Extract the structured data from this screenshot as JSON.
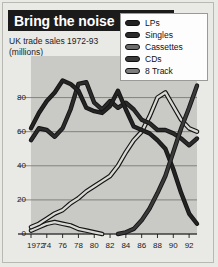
{
  "header": {
    "title": "Bring the noise",
    "subtitle_line1": "UK trade sales 1972-93",
    "subtitle_line2": "(millions)"
  },
  "source_note": "Source: BPI Surveys",
  "legend": {
    "items": [
      {
        "label": "LPs",
        "color": "#232323"
      },
      {
        "label": "Singles",
        "color": "#2b2b2b"
      },
      {
        "label": "Cassettes",
        "color": "#6b6b6b"
      },
      {
        "label": "CDs",
        "color": "#3a3a3a"
      },
      {
        "label": "8 Track",
        "color": "#7d7d7d"
      }
    ]
  },
  "chart_data": {
    "type": "line",
    "title": "Bring the noise",
    "subtitle": "UK trade sales 1972-93 (millions)",
    "xlabel": "",
    "ylabel": "millions",
    "xlim": [
      1972,
      1993
    ],
    "ylim": [
      0,
      95
    ],
    "yticks": [
      0,
      20,
      40,
      60,
      80
    ],
    "xticks": [
      1972,
      1974,
      1976,
      1978,
      1980,
      1982,
      1984,
      1986,
      1988,
      1990,
      1992
    ],
    "xtick_labels": [
      "1972",
      "74",
      "76",
      "78",
      "80",
      "82",
      "84",
      "86",
      "88",
      "90",
      "92"
    ],
    "grid": true,
    "legend_position": "top-right",
    "x": [
      1972,
      1973,
      1974,
      1975,
      1976,
      1977,
      1978,
      1979,
      1980,
      1981,
      1982,
      1983,
      1984,
      1985,
      1986,
      1987,
      1988,
      1989,
      1990,
      1991,
      1992,
      1993
    ],
    "series": [
      {
        "name": "LPs",
        "color": "#232323",
        "values": [
          62,
          71,
          78,
          83,
          90,
          88,
          84,
          74,
          72,
          71,
          75,
          84,
          73,
          63,
          61,
          59,
          55,
          50,
          38,
          24,
          12,
          6
        ]
      },
      {
        "name": "Singles",
        "color": "#2b2b2b",
        "values": [
          55,
          62,
          61,
          57,
          62,
          73,
          88,
          89,
          77,
          73,
          78,
          74,
          77,
          73,
          67,
          65,
          61,
          61,
          59,
          56,
          52,
          56
        ]
      },
      {
        "name": "Cassettes",
        "color": "#6b6b6b",
        "values": [
          4,
          6,
          9,
          12,
          14,
          18,
          21,
          25,
          28,
          31,
          34,
          40,
          48,
          55,
          60,
          69,
          80,
          83,
          75,
          67,
          62,
          60
        ]
      },
      {
        "name": "CDs",
        "color": "#3a3a3a",
        "values": [
          0,
          0,
          0,
          0,
          0,
          0,
          0,
          0,
          0,
          0,
          0,
          0,
          1,
          3,
          8,
          15,
          24,
          34,
          48,
          62,
          74,
          87
        ]
      },
      {
        "name": "8 Track",
        "color": "#7d7d7d",
        "values": [
          2,
          4,
          6,
          7,
          6,
          5,
          3,
          2,
          1,
          0,
          0,
          0,
          0,
          0,
          0,
          0,
          0,
          0,
          0,
          0,
          0,
          0
        ]
      }
    ]
  }
}
